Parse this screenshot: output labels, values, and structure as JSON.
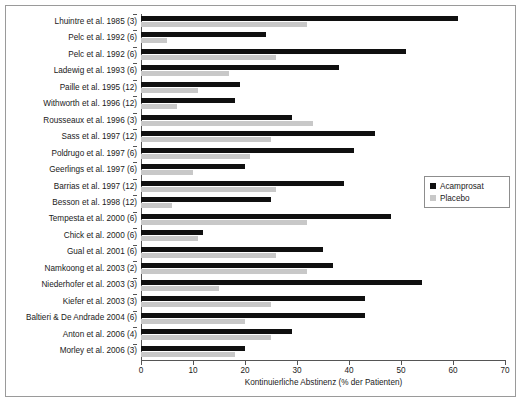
{
  "chart_data": {
    "type": "bar",
    "orientation": "horizontal",
    "title": "",
    "xlabel": "Kontinuierliche Abstinenz (% der Patienten)",
    "ylabel": "",
    "xlim": [
      0,
      70
    ],
    "xticks": [
      0,
      10,
      20,
      30,
      40,
      50,
      60,
      70
    ],
    "grid": false,
    "legend_position": "right-middle",
    "categories": [
      "Lhuintre et al. 1985 (3)",
      "Pelc et al. 1992 (6)",
      "Pelc et al. 1992 (6)",
      "Ladewig et al. 1993 (6)",
      "Paille et al. 1995 (12)",
      "Withworth et al. 1996 (12)",
      "Rousseaux et al. 1996 (3)",
      "Sass et al. 1997 (12)",
      "Poldrugo et al. 1997 (6)",
      "Geerlings et al. 1997 (6)",
      "Barrias et al. 1997 (12)",
      "Besson et al. 1998 (12)",
      "Tempesta et al. 2000 (6)",
      "Chick et al. 2000 (6)",
      "Gual et al. 2001 (6)",
      "Namkoong et al. 2003 (2)",
      "Niederhofer et al. 2003 (3)",
      "Kiefer et al. 2003 (3)",
      "Baltieri & De Andrade 2004 (6)",
      "Anton et al. 2006 (4)",
      "Morley et al. 2006 (3)"
    ],
    "series": [
      {
        "name": "Acamprosat",
        "color": "#101010",
        "values": [
          61,
          24,
          51,
          38,
          19,
          18,
          29,
          45,
          41,
          20,
          39,
          25,
          48,
          12,
          35,
          37,
          54,
          43,
          43,
          29,
          20
        ]
      },
      {
        "name": "Placebo",
        "color": "#c8c8c8",
        "values": [
          32,
          5,
          26,
          17,
          11,
          7,
          33,
          25,
          21,
          10,
          26,
          6,
          32,
          11,
          26,
          32,
          15,
          25,
          20,
          25,
          18
        ]
      }
    ]
  },
  "legend": {
    "items": [
      {
        "label": "Acamprosat",
        "color": "#101010"
      },
      {
        "label": "Placebo",
        "color": "#c8c8c8"
      }
    ]
  }
}
